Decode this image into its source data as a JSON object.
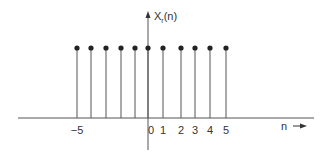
{
  "chart_data": {
    "type": "stem",
    "title": "",
    "ylabel": "X_r(n)",
    "ylabel_main": "X",
    "ylabel_sub": "r",
    "ylabel_arg": "(n)",
    "xlabel": "n",
    "x": [
      -5,
      -4,
      -3,
      -2,
      -1,
      0,
      1,
      2,
      3,
      4,
      5
    ],
    "values": [
      1,
      1,
      1,
      1,
      1,
      1,
      1,
      1,
      1,
      1,
      1
    ],
    "tick_labels": [
      {
        "n": -5,
        "label": "−5"
      },
      {
        "n": 0,
        "label": "0"
      },
      {
        "n": 1,
        "label": "1"
      },
      {
        "n": 2,
        "label": "2"
      },
      {
        "n": 3,
        "label": "3"
      },
      {
        "n": 4,
        "label": "4"
      },
      {
        "n": 5,
        "label": "5"
      }
    ],
    "stem_px": [
      77,
      91,
      106,
      121,
      135,
      148,
      163,
      181,
      195,
      210,
      226
    ],
    "grid": false,
    "legend": "none",
    "colors": {
      "stem": "#555555",
      "marker": "#222222",
      "axis": "#555555"
    }
  }
}
